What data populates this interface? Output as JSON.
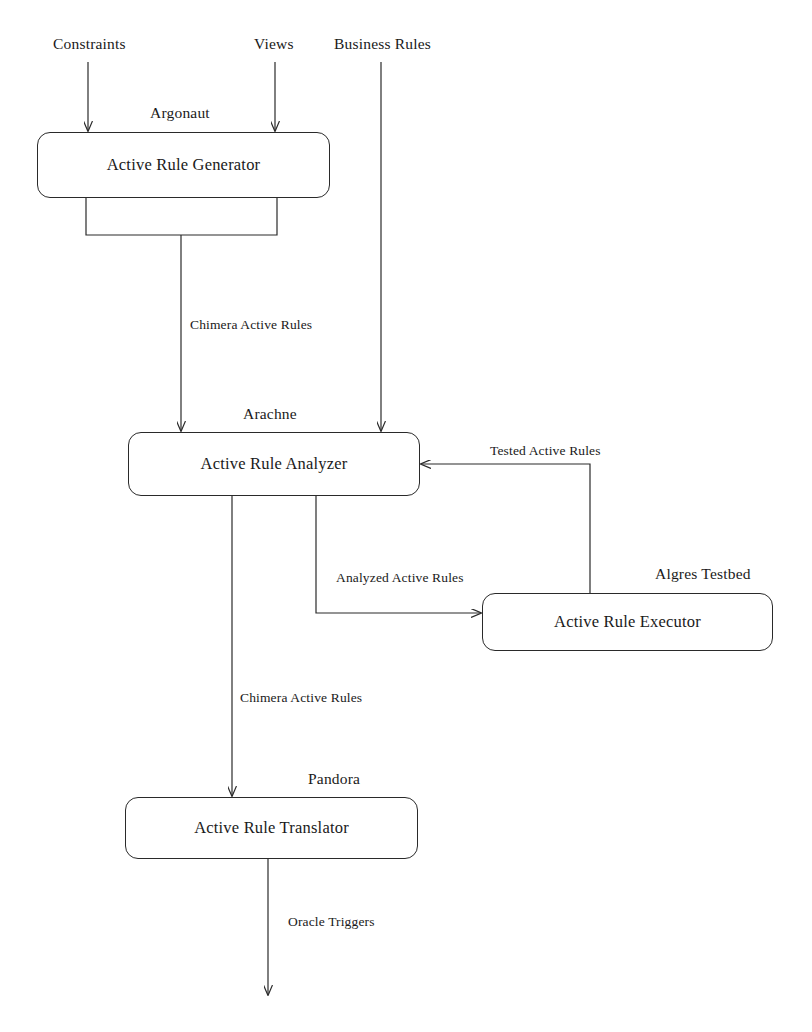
{
  "diagram": {
    "background_color": "#ffffff",
    "line_color": "#2a2a2a",
    "nodes": [
      {
        "id": "generator",
        "label": "Active Rule Generator",
        "caption": "Argonaut",
        "x": 37,
        "y": 132,
        "width": 293,
        "height": 66,
        "caption_x": 150,
        "caption_y": 104
      },
      {
        "id": "analyzer",
        "label": "Active Rule Analyzer",
        "caption": "Arachne",
        "x": 128,
        "y": 432,
        "width": 292,
        "height": 64,
        "caption_x": 243,
        "caption_y": 405
      },
      {
        "id": "executor",
        "label": "Active Rule Executor",
        "caption": "Algres Testbed",
        "x": 482,
        "y": 593,
        "width": 291,
        "height": 58,
        "caption_x": 655,
        "caption_y": 565
      },
      {
        "id": "translator",
        "label": "Active Rule Translator",
        "caption": "Pandora",
        "x": 125,
        "y": 797,
        "width": 293,
        "height": 62,
        "caption_x": 308,
        "caption_y": 770
      }
    ],
    "input_labels": [
      {
        "id": "constraints",
        "text": "Constraints",
        "x": 53,
        "y": 35
      },
      {
        "id": "views",
        "text": "Views",
        "x": 254,
        "y": 35
      },
      {
        "id": "business-rules",
        "text": "Business Rules",
        "x": 334,
        "y": 35
      }
    ],
    "edge_labels": [
      {
        "id": "chimera-active-rules-upper",
        "text": "Chimera Active Rules",
        "x": 190,
        "y": 317
      },
      {
        "id": "tested-active-rules",
        "text": "Tested Active Rules",
        "x": 490,
        "y": 443
      },
      {
        "id": "analyzed-active-rules",
        "text": "Analyzed Active Rules",
        "x": 336,
        "y": 570
      },
      {
        "id": "chimera-active-rules-lower",
        "text": "Chimera Active Rules",
        "x": 240,
        "y": 690
      },
      {
        "id": "oracle-triggers",
        "text": "Oracle Triggers",
        "x": 288,
        "y": 914
      }
    ]
  }
}
